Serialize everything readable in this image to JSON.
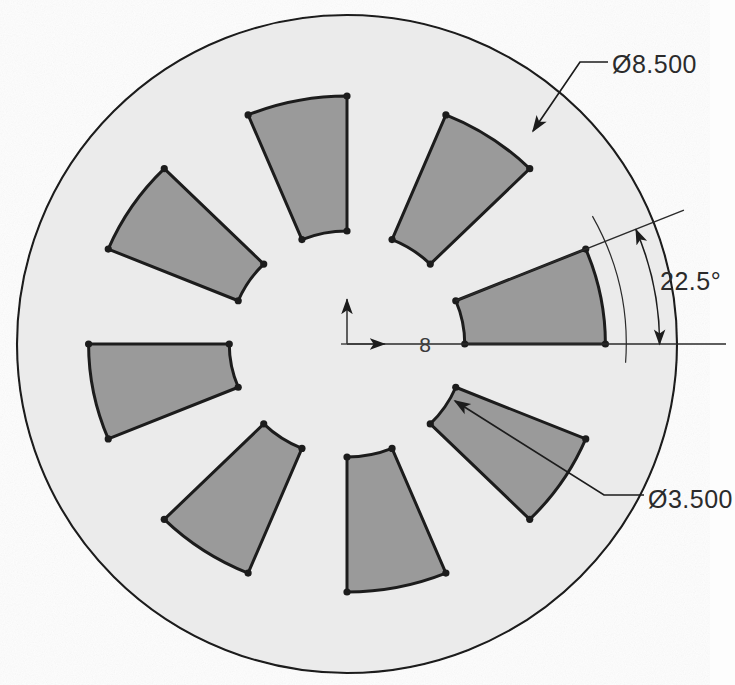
{
  "drawing": {
    "title": "Slotted disc sector pattern",
    "background_color": "#fdfdfd",
    "disc_fill": "#ebebeb",
    "sector_fill": "#9a9a9a",
    "line_color": "#1c1c1c",
    "center": {
      "x": 347,
      "y": 344
    },
    "outer_radius": 318,
    "disc_radius": 316
  },
  "geometry": {
    "pattern_count": 8,
    "sector_angular_width_deg": 22.5,
    "sector_pitch_deg": 45,
    "sector_inner_radius": 113,
    "sector_outer_radius": 248,
    "first_sector_start_angle_deg": 0,
    "ellipse_scale_x": 1.042,
    "ellipse_scale_y": 1.0
  },
  "annotations": {
    "outer_diameter": {
      "label": "Ø8.500",
      "text_x": 612,
      "text_y": 73,
      "leader": {
        "tip_x": 533,
        "tip_y": 131,
        "elbow_x": 580,
        "elbow_y": 62,
        "tail_x": 608,
        "tail_y": 62
      }
    },
    "inner_diameter": {
      "label": "Ø3.500",
      "text_x": 648,
      "text_y": 508,
      "leader": {
        "tip_x": 455,
        "tip_y": 401,
        "elbow_x": 604,
        "elbow_y": 495,
        "tail_x": 644,
        "tail_y": 495
      }
    },
    "angle": {
      "label": "22.5°",
      "text_x": 660,
      "text_y": 290,
      "value_deg": 22.5,
      "arc_radius": 300,
      "ray_length": 350
    },
    "quantity": {
      "label": "8",
      "text_x": 425,
      "text_y": 352
    },
    "origin_marker": {
      "x": 347,
      "y": 344,
      "axis_length": 45,
      "x_axis_name": "x-axis-arrow",
      "y_axis_name": "y-axis-arrow"
    },
    "datum_line": {
      "start_x": 347,
      "end_x": 726,
      "y": 344
    }
  }
}
